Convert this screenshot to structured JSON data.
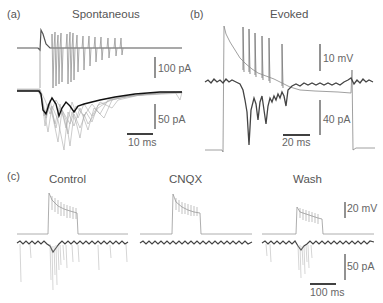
{
  "figure": {
    "panels": [
      {
        "id": "a",
        "label": "(a)",
        "title": "Spontaneous",
        "scale_bars": {
          "upper_current": "100 pA",
          "lower_current": "50 pA",
          "time": "10 ms"
        }
      },
      {
        "id": "b",
        "label": "(b)",
        "title": "Evoked",
        "scale_bars": {
          "voltage": "10 mV",
          "current": "40 pA",
          "time": "20 ms"
        }
      },
      {
        "id": "c",
        "label": "(c)",
        "conditions": [
          "Control",
          "CNQX",
          "Wash"
        ],
        "scale_bars": {
          "voltage": "20 mV",
          "current": "50 pA",
          "time": "100 ms"
        }
      }
    ],
    "colors": {
      "trace_dark": "#444444",
      "trace_light": "#9a9a9a",
      "average_trace": "#111111",
      "scale_bar": "#777777",
      "time_bar": "#111111",
      "text": "#555555"
    }
  }
}
